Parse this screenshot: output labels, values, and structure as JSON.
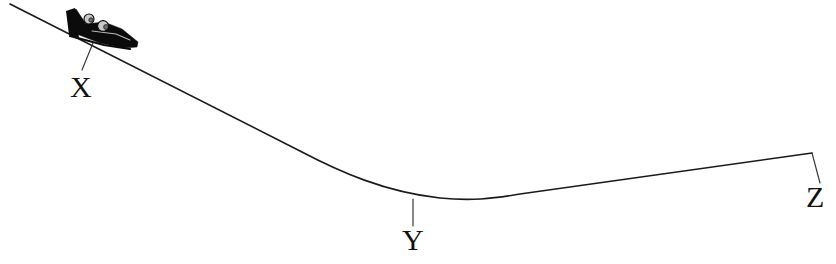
{
  "figure": {
    "kind": "physics-track-profile-diagram",
    "background_color": "#ffffff",
    "line_color": "#1a1a1a",
    "label_color": "#111111",
    "width": 836,
    "height": 264
  },
  "labels": {
    "x": "X",
    "y": "Y",
    "z": "Z"
  },
  "label_positions": {
    "x": {
      "text_x": 70,
      "text_y": 97
    },
    "y": {
      "text_x": 402,
      "text_y": 250
    },
    "z": {
      "text_x": 806,
      "text_y": 207
    }
  },
  "leaders": {
    "x_leader": "M 93 43 L 82 70",
    "y_leader": "M 413 199 L 413 226",
    "z_leader": "M 812 153 L 820 183"
  },
  "track": {
    "description": "Bobsled run profile: steep straight descent from upper left, curved valley, gentle rise to the right end",
    "path": "M 10 4 L 300 151 C 340 172 385 192 440 198 C 470 201 492 199 520 194 L 812 153",
    "start_point": {
      "x": 10,
      "y": 4
    },
    "valley_point": {
      "x": 462,
      "y": 200
    },
    "end_point": {
      "x": 812,
      "y": 153
    }
  },
  "sled": {
    "name": "bobsled",
    "riders": 2,
    "bounds": {
      "x": 66,
      "y": 8,
      "width": 76,
      "height": 42
    },
    "body_path": "M 68 13 L 76 9 L 86 24 L 104 22 L 122 29 L 138 42 L 137 47 L 124 48 L 100 43 L 74 33 Z",
    "tail_path": "M 66 11 L 75 8 L 79 38 L 69 35 Z",
    "runner_path": "M 70 36 L 104 45 L 130 49",
    "highlight_path": "M 92 31 L 116 34 L 130 40",
    "riders_detail": [
      {
        "helmet_cx": 89,
        "helmet_cy": 19,
        "helmet_r": 5.0,
        "visor_cx": 91,
        "visor_cy": 20,
        "visor_r": 2.2
      },
      {
        "helmet_cx": 103,
        "helmet_cy": 26,
        "helmet_r": 5.4,
        "visor_cx": 106,
        "visor_cy": 27,
        "visor_r": 2.4
      }
    ]
  }
}
